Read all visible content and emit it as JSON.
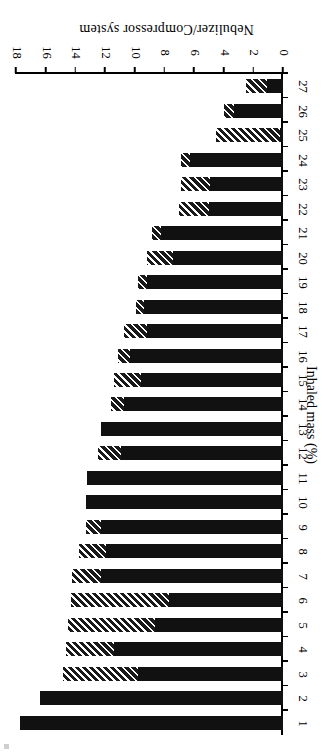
{
  "chart_data": {
    "type": "bar",
    "orientation": "horizontal-rotated-180",
    "title": "",
    "xlabel": "Nebulizer/Compressor system",
    "ylabel": "Inhaled mass (%)",
    "categories": [
      "1",
      "2",
      "3",
      "4",
      "5",
      "6",
      "7",
      "8",
      "9",
      "10",
      "11",
      "12",
      "13",
      "14",
      "15",
      "16",
      "17",
      "18",
      "19",
      "20",
      "21",
      "22",
      "23",
      "24",
      "25",
      "26",
      "27"
    ],
    "ylim": [
      0,
      18
    ],
    "ytick_labels": [
      "0",
      "2",
      "4",
      "6",
      "8",
      "10",
      "12",
      "14",
      "16",
      "18"
    ],
    "ytick_values": [
      0,
      2,
      4,
      6,
      8,
      10,
      12,
      14,
      16,
      18
    ],
    "grid": false,
    "legend": "none",
    "stacked": true,
    "series": [
      {
        "name": "solid-segment",
        "fill": "solid-black",
        "values": [
          17.7,
          16.4,
          9.8,
          11.4,
          8.6,
          7.7,
          12.3,
          11.9,
          12.3,
          13.3,
          13.2,
          10.9,
          12.3,
          10.7,
          9.6,
          10.3,
          9.2,
          9.4,
          9.2,
          7.4,
          8.2,
          5.0,
          4.9,
          6.3,
          0.2,
          3.3,
          1.1
        ]
      },
      {
        "name": "hatched-segment",
        "fill": "diagonal-hatch",
        "values": [
          0.0,
          0.0,
          5.0,
          3.2,
          5.9,
          6.6,
          1.9,
          1.85,
          1.0,
          0.0,
          0.0,
          1.6,
          0.0,
          0.9,
          1.8,
          0.8,
          1.5,
          0.5,
          0.6,
          1.8,
          0.6,
          2.0,
          2.0,
          0.6,
          4.3,
          0.7,
          1.4
        ]
      }
    ],
    "totals": [
      17.7,
      16.4,
      14.8,
      14.6,
      14.5,
      14.3,
      14.2,
      13.75,
      13.3,
      13.3,
      13.2,
      12.5,
      12.3,
      11.6,
      11.4,
      11.1,
      10.7,
      9.9,
      9.8,
      9.2,
      8.8,
      7.0,
      6.9,
      6.9,
      4.5,
      4.0,
      2.5
    ]
  },
  "colors": {
    "bar_solid": "#111111",
    "hatch_dark": "#1a1a1a",
    "hatch_light": "#ffffff",
    "axis": "#000000",
    "background": "#ffffff"
  }
}
